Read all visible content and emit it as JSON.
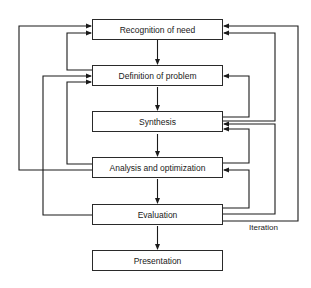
{
  "diagram": {
    "type": "flowchart",
    "nodes": [
      {
        "id": "recognition",
        "label": "Recognition of need"
      },
      {
        "id": "definition",
        "label": "Definition of problem"
      },
      {
        "id": "synthesis",
        "label": "Synthesis"
      },
      {
        "id": "analysis",
        "label": "Analysis and optimization"
      },
      {
        "id": "evaluation",
        "label": "Evaluation"
      },
      {
        "id": "presentation",
        "label": "Presentation"
      }
    ],
    "edges": [
      {
        "from": "recognition",
        "to": "definition"
      },
      {
        "from": "definition",
        "to": "synthesis"
      },
      {
        "from": "synthesis",
        "to": "analysis"
      },
      {
        "from": "analysis",
        "to": "evaluation"
      },
      {
        "from": "evaluation",
        "to": "presentation"
      },
      {
        "from": "definition",
        "to": "recognition",
        "side": "left"
      },
      {
        "from": "analysis",
        "to": "recognition",
        "side": "left"
      },
      {
        "from": "analysis",
        "to": "definition",
        "side": "left"
      },
      {
        "from": "evaluation",
        "to": "definition",
        "side": "left"
      },
      {
        "from": "synthesis",
        "to": "recognition",
        "side": "right"
      },
      {
        "from": "evaluation",
        "to": "recognition",
        "side": "right"
      },
      {
        "from": "synthesis",
        "to": "definition",
        "side": "right"
      },
      {
        "from": "analysis",
        "to": "synthesis",
        "side": "right"
      },
      {
        "from": "evaluation",
        "to": "synthesis",
        "side": "right"
      },
      {
        "from": "evaluation",
        "to": "analysis",
        "side": "right"
      }
    ],
    "annotation": "Iteration"
  }
}
